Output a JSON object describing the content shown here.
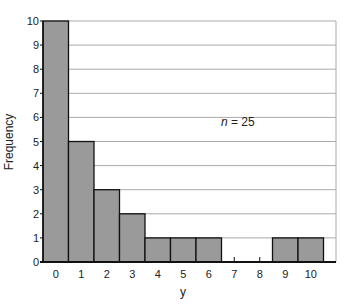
{
  "chart_data": {
    "type": "bar",
    "subtype": "histogram",
    "title": "",
    "xlabel": "y",
    "ylabel": "Frequency",
    "categories": [
      "0",
      "1",
      "2",
      "3",
      "4",
      "5",
      "6",
      "7",
      "8",
      "9",
      "10"
    ],
    "values": [
      10,
      5,
      3,
      2,
      1,
      1,
      1,
      0,
      0,
      1,
      1
    ],
    "ylim": [
      0,
      10
    ],
    "yticks": [
      0,
      1,
      2,
      3,
      4,
      5,
      6,
      7,
      8,
      9,
      10
    ],
    "grid": "horizontal",
    "annotation": {
      "prefix": "n",
      "text": " = 25"
    },
    "colors": {
      "bar_fill": "#9a9a9a",
      "bar_edge": "#111111",
      "grid": "#aaaaaa",
      "axis": "#111111"
    }
  }
}
